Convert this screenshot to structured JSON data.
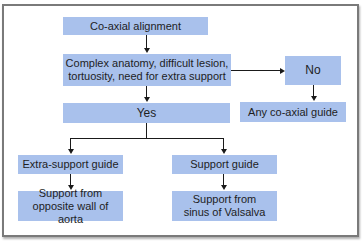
{
  "diagram": {
    "type": "flowchart",
    "colors": {
      "box_fill": "#a9c1ec",
      "line": "#1a1a1a",
      "frame": "#7a7a7a"
    },
    "nodes": {
      "start": "Co-axial alignment",
      "question": "Complex anatomy, difficult lesion, tortuosity, need for extra support",
      "no": "No",
      "no_result": "Any co-axial guide",
      "yes": "Yes",
      "extra_support": "Extra-support guide",
      "support": "Support guide",
      "extra_support_result": "Support from opposite wall of aorta",
      "support_result": "Support from sinus of Valsalva"
    },
    "edges": [
      [
        "start",
        "question"
      ],
      [
        "question",
        "no"
      ],
      [
        "no",
        "no_result"
      ],
      [
        "question",
        "yes"
      ],
      [
        "yes",
        "extra_support"
      ],
      [
        "yes",
        "support"
      ],
      [
        "extra_support",
        "extra_support_result"
      ],
      [
        "support",
        "support_result"
      ]
    ]
  }
}
